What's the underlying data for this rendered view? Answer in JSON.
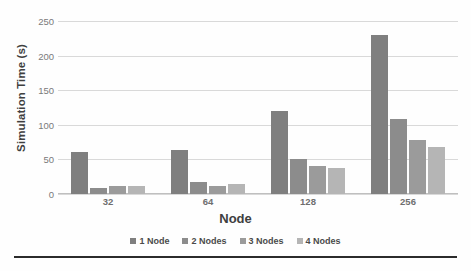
{
  "chart_data": {
    "type": "bar",
    "title": "",
    "xlabel": "Node",
    "ylabel": "Simulation Time (s)",
    "categories": [
      "32",
      "64",
      "128",
      "256"
    ],
    "ylim": [
      0,
      250
    ],
    "yticks": [
      0,
      50,
      100,
      150,
      200,
      250
    ],
    "ytick_labels": [
      "0",
      "50",
      "100",
      "150",
      "200",
      "250"
    ],
    "grid": true,
    "legend_position": "bottom",
    "series": [
      {
        "name": "1 Node",
        "color": "#7f7f7f",
        "values": [
          60,
          64,
          120,
          230
        ]
      },
      {
        "name": "2 Nodes",
        "color": "#8c8c8c",
        "values": [
          9,
          17,
          50,
          109
        ]
      },
      {
        "name": "3 Nodes",
        "color": "#9b9b9b",
        "values": [
          11,
          12,
          40,
          78
        ]
      },
      {
        "name": "4 Nodes",
        "color": "#b5b5b5",
        "values": [
          11,
          14,
          37,
          68
        ]
      }
    ]
  }
}
